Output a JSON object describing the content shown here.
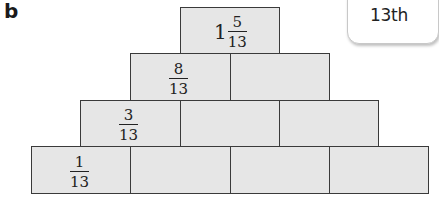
{
  "problem_label": "b",
  "callout": {
    "text": "13th"
  },
  "pyramid": {
    "rows": [
      {
        "row": 1,
        "bricks": [
          {
            "whole": "1",
            "numerator": "5",
            "denominator": "13"
          }
        ]
      },
      {
        "row": 2,
        "bricks": [
          {
            "numerator": "8",
            "denominator": "13"
          },
          {
            "value": ""
          }
        ]
      },
      {
        "row": 3,
        "bricks": [
          {
            "numerator": "3",
            "denominator": "13"
          },
          {
            "value": ""
          },
          {
            "value": ""
          }
        ]
      },
      {
        "row": 4,
        "bricks": [
          {
            "numerator": "1",
            "denominator": "13"
          },
          {
            "value": ""
          },
          {
            "value": ""
          },
          {
            "value": ""
          }
        ]
      }
    ]
  },
  "colors": {
    "brick_fill": "#e6e6e6",
    "brick_border": "#3a3a3a",
    "text": "#222222"
  }
}
